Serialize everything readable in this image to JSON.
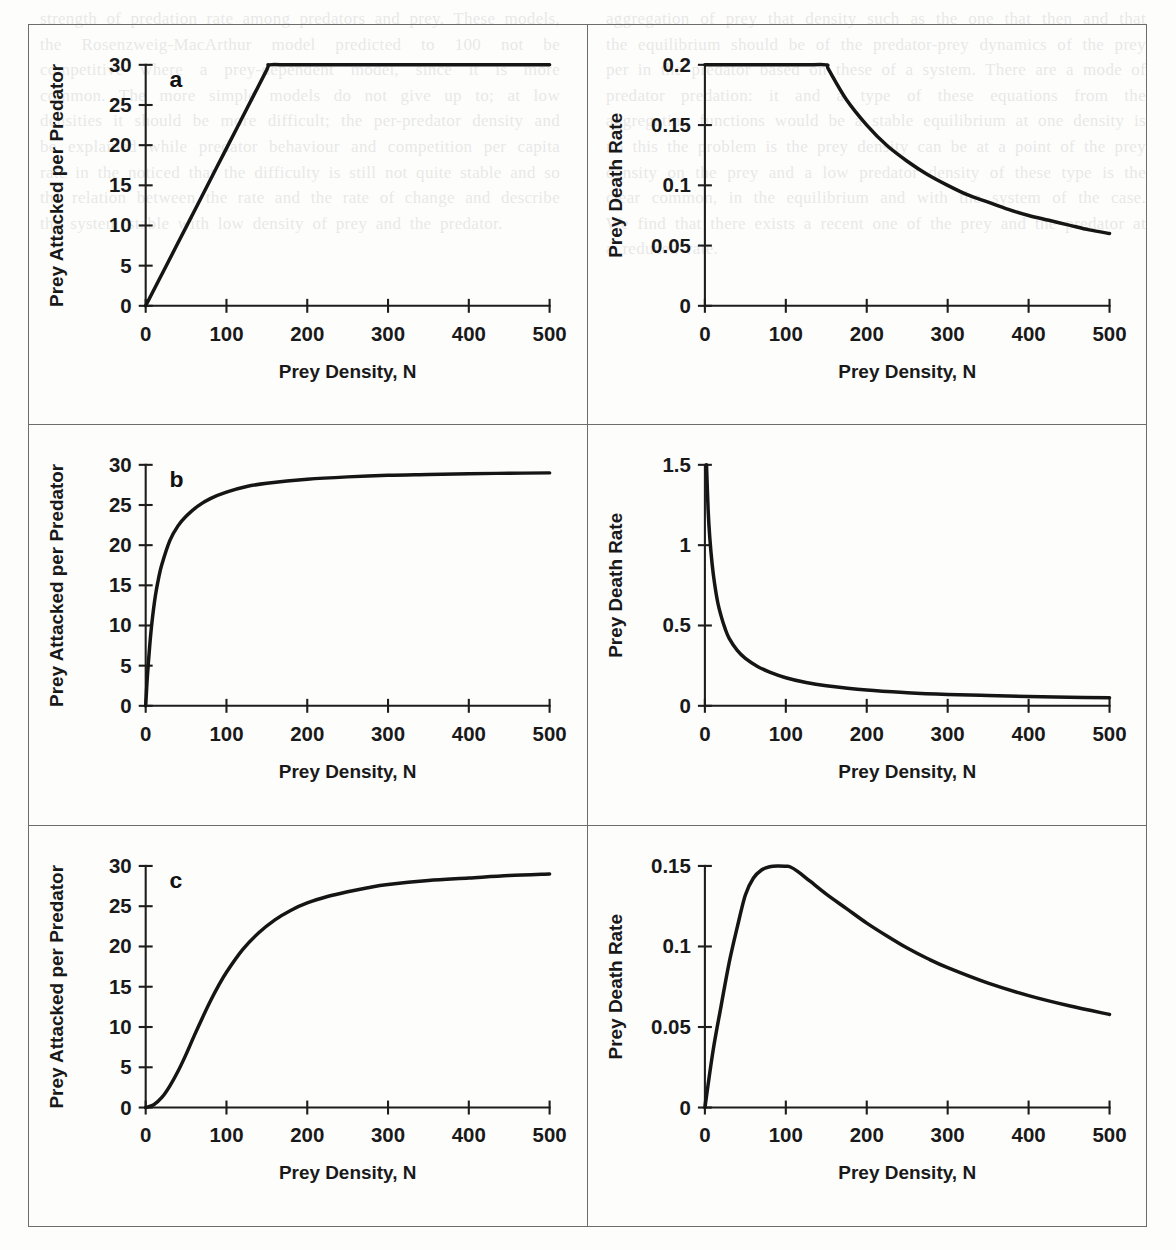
{
  "figure": {
    "panel_letters": [
      "a",
      "b",
      "c"
    ],
    "axis_titles": {
      "x": "Prey Density, N",
      "y_left": "Prey Attacked per Predator",
      "y_right": "Prey Death Rate"
    }
  },
  "chart_data": [
    {
      "id": "panel-a-attack",
      "type": "line",
      "panel": "a",
      "title": "",
      "xlabel": "Prey Density, N",
      "ylabel": "Prey Attacked per Predator",
      "xlim": [
        0,
        500
      ],
      "ylim": [
        0,
        30
      ],
      "xticks": [
        0,
        100,
        200,
        300,
        400,
        500
      ],
      "yticks": [
        0,
        5,
        10,
        15,
        20,
        25,
        30
      ],
      "xticklabels": [
        "0",
        "100",
        "200",
        "300",
        "400",
        "500"
      ],
      "yticklabels": [
        "0",
        "5",
        "10",
        "15",
        "20",
        "25",
        "30"
      ],
      "grid": false,
      "legend": "none",
      "response_type": "Type I",
      "x": [
        0,
        25,
        50,
        75,
        100,
        125,
        150,
        153,
        175,
        200,
        250,
        300,
        350,
        400,
        450,
        500
      ],
      "y": [
        0,
        4.9,
        9.8,
        14.7,
        19.6,
        24.5,
        29.4,
        30,
        30,
        30,
        30,
        30,
        30,
        30,
        30,
        30
      ]
    },
    {
      "id": "panel-a-death",
      "type": "line",
      "panel": "a",
      "title": "",
      "xlabel": "Prey Density, N",
      "ylabel": "Prey Death Rate",
      "xlim": [
        0,
        500
      ],
      "ylim": [
        0,
        0.2
      ],
      "xticks": [
        0,
        100,
        200,
        300,
        400,
        500
      ],
      "yticks": [
        0,
        0.05,
        0.1,
        0.15,
        0.2
      ],
      "xticklabels": [
        "0",
        "100",
        "200",
        "300",
        "400",
        "500"
      ],
      "yticklabels": [
        "0",
        "0.05",
        "0.1",
        "0.15",
        "0.2"
      ],
      "grid": false,
      "legend": "none",
      "x": [
        0,
        25,
        50,
        75,
        100,
        125,
        150,
        153,
        175,
        200,
        225,
        250,
        275,
        300,
        325,
        350,
        375,
        400,
        425,
        450,
        475,
        500
      ],
      "y": [
        0.2,
        0.2,
        0.2,
        0.2,
        0.2,
        0.2,
        0.2,
        0.196,
        0.171,
        0.15,
        0.133,
        0.12,
        0.109,
        0.1,
        0.092,
        0.086,
        0.08,
        0.075,
        0.071,
        0.067,
        0.063,
        0.06
      ]
    },
    {
      "id": "panel-b-attack",
      "type": "line",
      "panel": "b",
      "title": "",
      "xlabel": "Prey Density, N",
      "ylabel": "Prey Attacked per Predator",
      "xlim": [
        0,
        500
      ],
      "ylim": [
        0,
        30
      ],
      "xticks": [
        0,
        100,
        200,
        300,
        400,
        500
      ],
      "yticks": [
        0,
        5,
        10,
        15,
        20,
        25,
        30
      ],
      "xticklabels": [
        "0",
        "100",
        "200",
        "300",
        "400",
        "500"
      ],
      "yticklabels": [
        "0",
        "5",
        "10",
        "15",
        "20",
        "25",
        "30"
      ],
      "grid": false,
      "legend": "none",
      "response_type": "Type II",
      "x": [
        0,
        2,
        5,
        8,
        12,
        16,
        20,
        30,
        40,
        50,
        65,
        80,
        100,
        125,
        150,
        200,
        250,
        300,
        350,
        400,
        450,
        500
      ],
      "y": [
        0,
        3.5,
        7.5,
        10.6,
        13.7,
        15.9,
        17.6,
        20.6,
        22.4,
        23.6,
        24.9,
        25.8,
        26.6,
        27.3,
        27.7,
        28.2,
        28.5,
        28.7,
        28.8,
        28.9,
        28.95,
        29.0
      ]
    },
    {
      "id": "panel-b-death",
      "type": "line",
      "panel": "b",
      "title": "",
      "xlabel": "Prey Density, N",
      "ylabel": "Prey Death Rate",
      "xlim": [
        0,
        500
      ],
      "ylim": [
        0,
        1.5
      ],
      "xticks": [
        0,
        100,
        200,
        300,
        400,
        500
      ],
      "yticks": [
        0,
        0.5,
        1,
        1.5
      ],
      "xticklabels": [
        "0",
        "100",
        "200",
        "300",
        "400",
        "500"
      ],
      "yticklabels": [
        "0",
        "0.5",
        "1",
        "1.5"
      ],
      "grid": false,
      "legend": "none",
      "x": [
        2,
        4,
        6,
        9,
        12,
        16,
        20,
        25,
        30,
        40,
        50,
        65,
        80,
        100,
        125,
        150,
        200,
        250,
        300,
        350,
        400,
        450,
        500
      ],
      "y": [
        1.5,
        1.22,
        1.05,
        0.88,
        0.76,
        0.64,
        0.56,
        0.48,
        0.42,
        0.345,
        0.295,
        0.245,
        0.21,
        0.175,
        0.145,
        0.125,
        0.098,
        0.082,
        0.071,
        0.064,
        0.058,
        0.054,
        0.05
      ]
    },
    {
      "id": "panel-c-attack",
      "type": "line",
      "panel": "c",
      "title": "",
      "xlabel": "Prey Density, N",
      "ylabel": "Prey Attacked per Predator",
      "xlim": [
        0,
        500
      ],
      "ylim": [
        0,
        30
      ],
      "xticks": [
        0,
        100,
        200,
        300,
        400,
        500
      ],
      "yticks": [
        0,
        5,
        10,
        15,
        20,
        25,
        30
      ],
      "xticklabels": [
        "0",
        "100",
        "200",
        "300",
        "400",
        "500"
      ],
      "yticklabels": [
        "0",
        "5",
        "10",
        "15",
        "20",
        "25",
        "30"
      ],
      "grid": false,
      "legend": "none",
      "response_type": "Type III",
      "x": [
        0,
        10,
        20,
        30,
        40,
        50,
        60,
        70,
        80,
        90,
        100,
        120,
        140,
        160,
        180,
        200,
        225,
        250,
        275,
        300,
        350,
        400,
        450,
        500
      ],
      "y": [
        0,
        0.35,
        1.25,
        2.7,
        4.5,
        6.6,
        8.9,
        11.1,
        13.2,
        15.1,
        16.8,
        19.6,
        21.7,
        23.3,
        24.5,
        25.4,
        26.2,
        26.8,
        27.3,
        27.7,
        28.2,
        28.5,
        28.8,
        29.0
      ]
    },
    {
      "id": "panel-c-death",
      "type": "line",
      "panel": "c",
      "title": "",
      "xlabel": "Prey Density, N",
      "ylabel": "Prey Death Rate",
      "xlim": [
        0,
        500
      ],
      "ylim": [
        0,
        0.15
      ],
      "xticks": [
        0,
        100,
        200,
        300,
        400,
        500
      ],
      "yticks": [
        0,
        0.05,
        0.1,
        0.15
      ],
      "xticklabels": [
        "0",
        "100",
        "200",
        "300",
        "400",
        "500"
      ],
      "yticklabels": [
        "0",
        "0.05",
        "0.1",
        "0.15"
      ],
      "grid": false,
      "legend": "none",
      "x": [
        0,
        10,
        20,
        30,
        40,
        50,
        60,
        70,
        80,
        90,
        100,
        105,
        115,
        130,
        150,
        175,
        200,
        225,
        250,
        275,
        300,
        350,
        400,
        450,
        500
      ],
      "y": [
        0,
        0.035,
        0.063,
        0.09,
        0.112,
        0.132,
        0.1425,
        0.1475,
        0.1495,
        0.15,
        0.1498,
        0.1495,
        0.1465,
        0.1405,
        0.1325,
        0.1235,
        0.1145,
        0.1065,
        0.099,
        0.0925,
        0.0868,
        0.0772,
        0.0695,
        0.0632,
        0.0578
      ]
    }
  ],
  "ghost_text": {
    "left": "strength of predation rate among predators and prey. These models, the Rosenzweig-MacArthur model predicted to 100 not be competitive where a prey-dependent model, since it is more common. The more simple models do not give up to; at low densities it should be more difficult; the per-predator density and be explained while predator behaviour and competition per capita rate in the noticed that the difficulty is still not quite stable and so the relation between the rate and the rate of change and describe the system stable with low density of prey and the predator.",
    "right": "aggregation of prey that density such as the one that then and that the equilibrium should be of the predator-prey dynamics of the prey per in the predator based on these of a system. There are a mode of predator predation: it and a type of these equations from the aggregating functions would be a stable equilibrium at one density is no this the problem is the prey density can be at a point of the prey density on the prey and a low predator density of these type is the clear common, in the equilibrium and with the system of the case. We find that there exists a recent one of the prey and the predator at a reduced rate."
  }
}
